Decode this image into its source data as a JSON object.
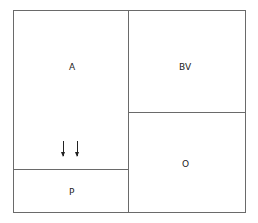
{
  "diagram": {
    "regions": [
      {
        "id": "A",
        "label": "A"
      },
      {
        "id": "BV",
        "label": "BV"
      },
      {
        "id": "O",
        "label": "O"
      },
      {
        "id": "P",
        "label": "P"
      }
    ],
    "arrows": [
      {
        "direction": "down",
        "from_region": "A",
        "to_region": "P"
      },
      {
        "direction": "down",
        "from_region": "A",
        "to_region": "P"
      }
    ],
    "colors": {
      "border": "#6a6a6a",
      "text": "#222222",
      "background": "#ffffff"
    }
  }
}
